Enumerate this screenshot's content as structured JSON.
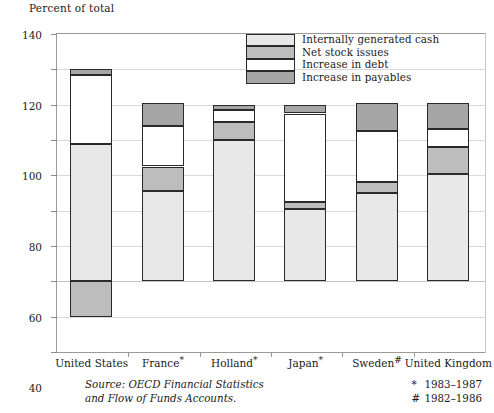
{
  "chart_data": {
    "type": "bar",
    "stacked": true,
    "title": "",
    "ylabel": "Percent of total",
    "xlabel": "",
    "ylim": [
      -40,
      140
    ],
    "ytick_step": 20,
    "yticks": [
      140,
      120,
      100,
      80,
      60,
      40,
      20,
      0,
      -20,
      -40
    ],
    "ytick_labels": [
      "140",
      "120",
      "100",
      "80",
      "60",
      "40",
      "20",
      "0",
      "–20",
      "–40"
    ],
    "grid": true,
    "legend_position": "top-right",
    "categories": [
      "United States",
      "France*",
      "Holland*",
      "Japan*",
      "Sweden#",
      "United Kingdom"
    ],
    "category_labels": [
      {
        "name": "United States",
        "mark": ""
      },
      {
        "name": "France",
        "mark": "*"
      },
      {
        "name": "Holland",
        "mark": "*"
      },
      {
        "name": "Japan",
        "mark": "*"
      },
      {
        "name": "Sweden",
        "mark": "#"
      },
      {
        "name": "United Kingdom",
        "mark": ""
      }
    ],
    "series": [
      {
        "name": "Internally generated cash",
        "color": "#e8e8e8",
        "values": [
          78,
          51,
          80,
          41,
          50,
          61
        ]
      },
      {
        "name": "Net stock issues",
        "color": "#bdbdbd",
        "values": [
          -20,
          14,
          10,
          4,
          6,
          15
        ]
      },
      {
        "name": "Increase in debt",
        "color": "#ffffff",
        "values": [
          39,
          23,
          7,
          50,
          29,
          10
        ]
      },
      {
        "name": "Increase in payables",
        "color": "#a6a6a6",
        "values": [
          3,
          13,
          3,
          5,
          16,
          15
        ]
      }
    ],
    "bar_totals": [
      120,
      101,
      100,
      100,
      101,
      101
    ],
    "bar_segments": [
      {
        "category": "United States",
        "stack": [
          {
            "series": "Net stock issues",
            "from": 0,
            "to": -20
          },
          {
            "series": "Internally generated cash",
            "from": 0,
            "to": 78
          },
          {
            "series": "Increase in debt",
            "from": 78,
            "to": 117
          },
          {
            "series": "Increase in payables",
            "from": 117,
            "to": 120
          }
        ]
      },
      {
        "category": "France*",
        "stack": [
          {
            "series": "Internally generated cash",
            "from": 0,
            "to": 51
          },
          {
            "series": "Net stock issues",
            "from": 51,
            "to": 65
          },
          {
            "series": "Increase in debt",
            "from": 65,
            "to": 88
          },
          {
            "series": "Increase in payables",
            "from": 88,
            "to": 101
          }
        ]
      },
      {
        "category": "Holland*",
        "stack": [
          {
            "series": "Internally generated cash",
            "from": 0,
            "to": 80
          },
          {
            "series": "Net stock issues",
            "from": 80,
            "to": 90
          },
          {
            "series": "Increase in debt",
            "from": 90,
            "to": 97
          },
          {
            "series": "Increase in payables",
            "from": 97,
            "to": 100
          }
        ]
      },
      {
        "category": "Japan*",
        "stack": [
          {
            "series": "Internally generated cash",
            "from": 0,
            "to": 41
          },
          {
            "series": "Net stock issues",
            "from": 41,
            "to": 45
          },
          {
            "series": "Increase in debt",
            "from": 45,
            "to": 95
          },
          {
            "series": "Increase in payables",
            "from": 95,
            "to": 100
          }
        ]
      },
      {
        "category": "Sweden#",
        "stack": [
          {
            "series": "Internally generated cash",
            "from": 0,
            "to": 50
          },
          {
            "series": "Net stock issues",
            "from": 50,
            "to": 56
          },
          {
            "series": "Increase in debt",
            "from": 56,
            "to": 85
          },
          {
            "series": "Increase in payables",
            "from": 85,
            "to": 101
          }
        ]
      },
      {
        "category": "United Kingdom",
        "stack": [
          {
            "series": "Internally generated cash",
            "from": 0,
            "to": 61
          },
          {
            "series": "Net stock issues",
            "from": 61,
            "to": 76
          },
          {
            "series": "Increase in debt",
            "from": 76,
            "to": 86
          },
          {
            "series": "Increase in payables",
            "from": 86,
            "to": 101
          }
        ]
      }
    ]
  },
  "legend": {
    "items": [
      {
        "label": "Internally generated cash",
        "color": "#e8e8e8"
      },
      {
        "label": "Net stock issues",
        "color": "#bdbdbd"
      },
      {
        "label": "Increase in debt",
        "color": "#ffffff"
      },
      {
        "label": "Increase in payables",
        "color": "#a6a6a6"
      }
    ]
  },
  "footer": {
    "source_line1": "Source: OECD Financial Statistics",
    "source_line2": "and Flow of Funds Accounts.",
    "notes": [
      {
        "symbol": "*",
        "text": "1983–1987"
      },
      {
        "symbol": "#",
        "text": "1982–1986"
      }
    ]
  }
}
